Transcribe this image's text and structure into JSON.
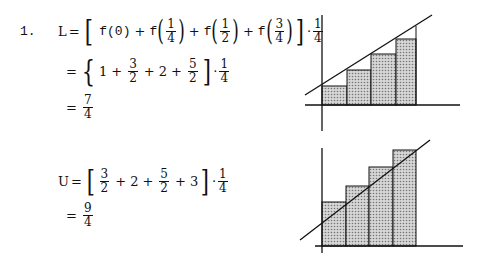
{
  "problem": {
    "number": "1.",
    "lower_sum": {
      "label": "L",
      "line1": {
        "eq": "=",
        "terms": [
          "f(0)",
          "f",
          "1",
          "4",
          "f",
          "1",
          "2",
          "f",
          "3",
          "4"
        ],
        "factor_num": "1",
        "factor_den": "4"
      },
      "line2": {
        "eq": "=",
        "t1": "1",
        "t2_num": "3",
        "t2_den": "2",
        "t3": "2",
        "t4_num": "5",
        "t4_den": "2",
        "factor_num": "1",
        "factor_den": "4"
      },
      "line3": {
        "eq": "=",
        "num": "7",
        "den": "4"
      }
    },
    "upper_sum": {
      "label": "U",
      "line1": {
        "eq": "=",
        "t1_num": "3",
        "t1_den": "2",
        "t2": "2",
        "t3_num": "5",
        "t3_den": "2",
        "t4": "3",
        "factor_num": "1",
        "factor_den": "4"
      },
      "line2": {
        "eq": "=",
        "num": "9",
        "den": "4"
      }
    }
  },
  "figures": {
    "lower_graph": {
      "description": "Left-endpoint rectangles under increasing line",
      "rectangles": 4
    },
    "upper_graph": {
      "description": "Right-endpoint rectangles above increasing line",
      "rectangles": 4
    },
    "fill_color": "#bdbdbd",
    "stroke_color": "#111111"
  },
  "symbols": {
    "plus": "+",
    "dot": "·",
    "f": "f",
    "lbracket": "[",
    "rbracket": "]",
    "lbrace": "{",
    "lparen": "(",
    "rparen": ")"
  }
}
